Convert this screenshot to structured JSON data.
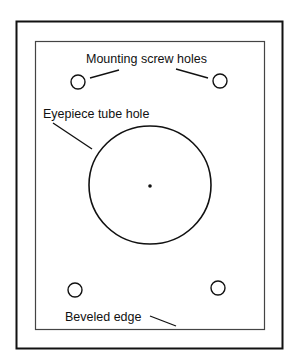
{
  "diagram": {
    "type": "eyepiece mounting plate",
    "colors": {
      "line": "#111111",
      "inner_line": "#444444",
      "background": "#ffffff"
    },
    "labels": {
      "mounting_screw_holes": "Mounting screw holes",
      "eyepiece_tube_hole": "Eyepiece tube hole",
      "beveled_edge": "Beveled edge"
    },
    "shapes": {
      "outer_plate": {
        "x": 16,
        "y": 21,
        "w": 266,
        "h": 327
      },
      "beveled_edge_inner": {
        "x": 35,
        "y": 41,
        "w": 229,
        "h": 288
      },
      "eyepiece_hole": {
        "cx": 150,
        "cy": 185,
        "rx": 61,
        "ry": 59
      },
      "center_dot": {
        "cx": 150,
        "cy": 186,
        "r": 1.8
      },
      "screw_holes": [
        {
          "cx": 78,
          "cy": 82,
          "r": 7
        },
        {
          "cx": 220,
          "cy": 81,
          "r": 7
        },
        {
          "cx": 75,
          "cy": 290,
          "r": 7
        },
        {
          "cx": 218,
          "cy": 288,
          "r": 7
        }
      ]
    }
  }
}
